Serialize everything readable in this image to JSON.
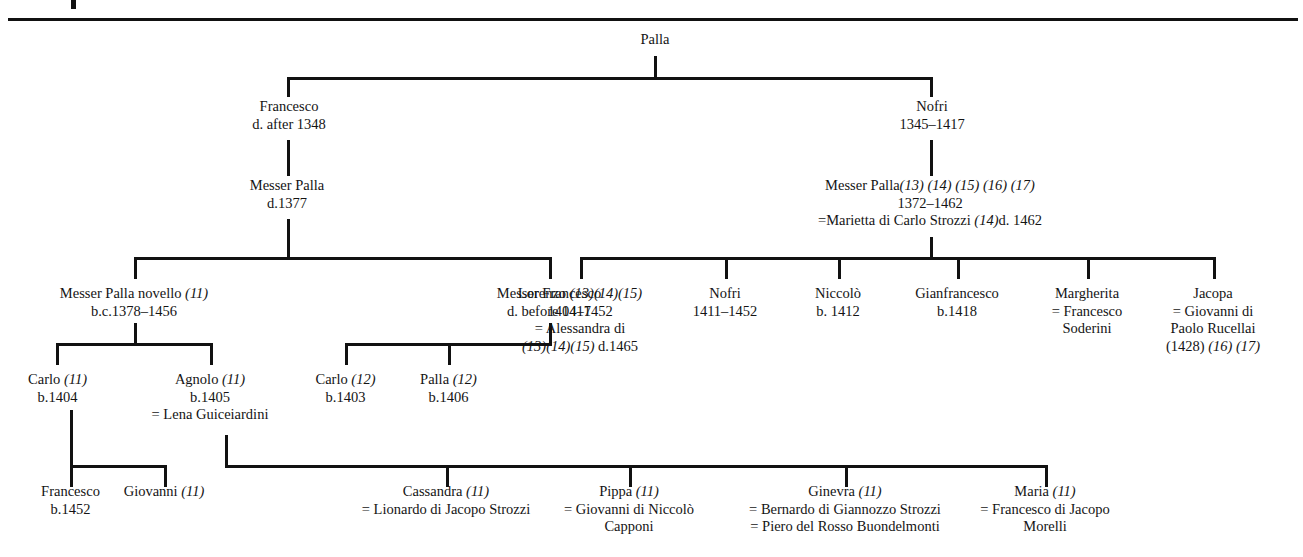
{
  "document": {
    "type": "genealogical-family-tree",
    "family": "Strozzi",
    "top_mark": "▌"
  },
  "nodes": {
    "palla_root": {
      "name": "Palla"
    },
    "francesco_1": {
      "name": "Francesco",
      "dates": "d. after 1348"
    },
    "nofri_1": {
      "name": "Nofri",
      "dates": "1345–1417"
    },
    "messer_palla_1377": {
      "name": "Messer Palla",
      "dates": "d.1377"
    },
    "messer_palla_1372": {
      "name": "Messer Palla",
      "refs": "(13) (14) (15) (16) (17)",
      "dates": "1372–1462",
      "spouse": "=Marietta di Carlo Strozzi ",
      "spouse_refs": "(14)",
      "spouse_dates": "d. 1462"
    },
    "messer_palla_novello": {
      "name": "Messer Palla novello ",
      "refs": "(11)",
      "dates": "b.c.1378–1456"
    },
    "messer_francesco": {
      "name": "Messer Francesco",
      "dates": "d. before 1417"
    },
    "lorenzo": {
      "name": "Lorenzo ",
      "refs": "(13)(14)(15)",
      "dates": "1404–1452",
      "spouse": "= Alessandra di",
      "spouse_refs": "(13)(14)(15)",
      "spouse_dates": " d.1465"
    },
    "nofri_2": {
      "name": "Nofri",
      "dates": "1411–1452"
    },
    "niccolo": {
      "name": "Niccolò",
      "dates": "b. 1412"
    },
    "gianfrancesco": {
      "name": "Gianfrancesco",
      "dates": "b.1418"
    },
    "margherita": {
      "name": "Margherita",
      "spouse_line1": "= Francesco",
      "spouse_line2": "Soderini"
    },
    "jacopa": {
      "name": "Jacopa",
      "spouse_line1": "= Giovanni di",
      "spouse_line2": "Paolo Rucellai",
      "year": "(1428) ",
      "refs": "(16) (17)"
    },
    "carlo_1404": {
      "name": "Carlo ",
      "refs": "(11)",
      "dates": "b.1404"
    },
    "agnolo": {
      "name": "Agnolo ",
      "refs": "(11)",
      "dates": "b.1405",
      "spouse": "= Lena Guiceiardini"
    },
    "carlo_1403": {
      "name": "Carlo ",
      "refs": "(12)",
      "dates": "b.1403"
    },
    "palla_1406": {
      "name": "Palla ",
      "refs": "(12)",
      "dates": "b.1406"
    },
    "francesco_1452": {
      "name": "Francesco",
      "dates": "b.1452"
    },
    "giovanni": {
      "name": "Giovanni ",
      "refs": "(11)"
    },
    "cassandra": {
      "name": "Cassandra ",
      "refs": "(11)",
      "spouse": "= Lionardo di Jacopo Strozzi"
    },
    "pippa": {
      "name": "Pippa ",
      "refs": "(11)",
      "spouse_line1": "= Giovanni di Niccolò",
      "spouse_line2": "Capponi"
    },
    "ginevra": {
      "name": "Ginevra ",
      "refs": "(11)",
      "spouse_line1": "= Bernardo di Giannozzo Strozzi",
      "spouse_line2": "= Piero del Rosso Buondelmonti"
    },
    "maria": {
      "name": "Maria ",
      "refs": "(11)",
      "spouse_line1": "= Francesco di Jacopo",
      "spouse_line2": "Morelli"
    }
  },
  "colors": {
    "ink": "#141414",
    "rule": "#111111",
    "paper": "#ffffff"
  }
}
